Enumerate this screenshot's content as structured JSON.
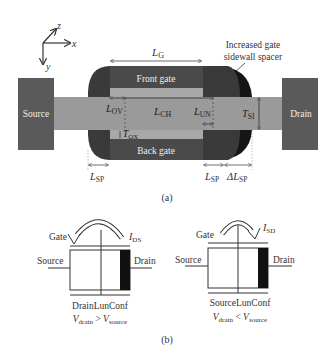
{
  "figure": {
    "panel_a": {
      "caption": "(a)",
      "axes": {
        "x": "x",
        "y": "y",
        "z": "z"
      },
      "regions": {
        "source": "Source",
        "drain": "Drain",
        "front_gate": "Front gate",
        "back_gate": "Back gate"
      },
      "callout": {
        "line1": "Increased gate",
        "line2": "sidewall spacer"
      },
      "dimensions": {
        "LG": {
          "main": "L",
          "sub": "G"
        },
        "LOV": {
          "main": "L",
          "sub": "OV"
        },
        "LCH": {
          "main": "L",
          "sub": "CH"
        },
        "LUN": {
          "main": "L",
          "sub": "UN"
        },
        "TSI": {
          "main": "T",
          "sub": "SI"
        },
        "TOX": {
          "main": "T",
          "sub": "OX"
        },
        "LSP_left": {
          "main": "L",
          "sub": "SP"
        },
        "LSP_right": {
          "main": "L",
          "sub": "SP"
        },
        "dLSP": {
          "main": "ΔL",
          "sub": "SP"
        }
      },
      "colors": {
        "pad": "#5a5a5a",
        "silicon": "#9a9a9a",
        "gate": "#3e3e3e",
        "oxide": "#a8a8a8",
        "spacer": "#1a1a1a",
        "spacer_extra": "#111111"
      }
    },
    "panel_b": {
      "caption": "(b)",
      "left": {
        "gate": "Gate",
        "source": "Source",
        "drain": "Drain",
        "current": {
          "main": "I",
          "sub": "DS"
        },
        "config": "DrainLunConf",
        "condition": {
          "lhs": "V",
          "lhs_sub": "drain",
          "op": " > ",
          "rhs": "V",
          "rhs_sub": "source"
        }
      },
      "right": {
        "gate": "Gate",
        "source": "Source",
        "drain": "Drain",
        "current": {
          "main": "I",
          "sub": "SD"
        },
        "config": "SourceLunConf",
        "condition": {
          "lhs": "V",
          "lhs_sub": "drain",
          "op": " < ",
          "rhs": "V",
          "rhs_sub": "source"
        }
      }
    }
  }
}
